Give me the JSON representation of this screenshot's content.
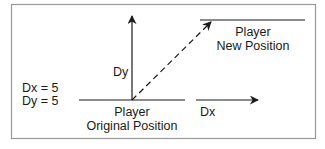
{
  "diagram": {
    "title": "",
    "labels": {
      "dy_axis": "Dy",
      "dx_axis": "Dx",
      "new_position_line1": "Player",
      "new_position_line2": "New Position",
      "original_position_line1": "Player",
      "original_position_line2": "Original Position",
      "dx_value": "Dx = 5",
      "dy_value": "Dy = 5"
    },
    "colors": {
      "line": "#1a1a1a",
      "border": "#999999",
      "background": "#ffffff"
    }
  }
}
